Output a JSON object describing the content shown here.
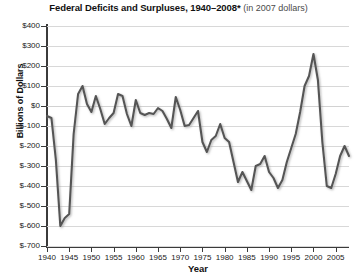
{
  "chart_data": {
    "type": "line",
    "title_main": "Federal Deficits and Surpluses, 1940–2008*",
    "title_sub": "(in 2007 dollars)",
    "xlabel": "Year",
    "ylabel": "Billions of Dollars",
    "grid": true,
    "legend": "none",
    "line_color": "#555555",
    "xlim": [
      1940,
      2008
    ],
    "ylim": [
      -700,
      400
    ],
    "ytick_values": [
      400,
      300,
      200,
      100,
      0,
      -100,
      -200,
      -300,
      -400,
      -500,
      -600,
      -700
    ],
    "ytick_labels": [
      "$400",
      "$300",
      "$200",
      "$100",
      "$0",
      "$-100",
      "$-200",
      "$-300",
      "$-400",
      "$-500",
      "$-600",
      "$-700"
    ],
    "xtick_values": [
      1940,
      1945,
      1950,
      1955,
      1960,
      1965,
      1970,
      1975,
      1980,
      1985,
      1990,
      1995,
      2000,
      2005
    ],
    "xtick_labels": [
      "1940",
      "1945",
      "1950",
      "1955",
      "1960",
      "1965",
      "1970",
      "1975",
      "1980",
      "1985",
      "1990",
      "1995",
      "2000",
      "2005"
    ],
    "x": [
      1940,
      1941,
      1942,
      1943,
      1944,
      1945,
      1946,
      1947,
      1948,
      1949,
      1950,
      1951,
      1952,
      1953,
      1954,
      1955,
      1956,
      1957,
      1958,
      1959,
      1960,
      1961,
      1962,
      1963,
      1964,
      1965,
      1966,
      1967,
      1968,
      1969,
      1970,
      1971,
      1972,
      1973,
      1974,
      1975,
      1976,
      1977,
      1978,
      1979,
      1980,
      1981,
      1982,
      1983,
      1984,
      1985,
      1986,
      1987,
      1988,
      1989,
      1990,
      1991,
      1992,
      1993,
      1994,
      1995,
      1996,
      1997,
      1998,
      1999,
      2000,
      2001,
      2002,
      2003,
      2004,
      2005,
      2006,
      2007,
      2008
    ],
    "values": [
      -50,
      -60,
      -270,
      -600,
      -560,
      -540,
      -140,
      60,
      100,
      10,
      -30,
      50,
      -15,
      -90,
      -60,
      -35,
      60,
      50,
      -40,
      -100,
      30,
      -35,
      -45,
      -35,
      -40,
      -10,
      -25,
      -65,
      -110,
      45,
      -20,
      -100,
      -95,
      -60,
      -25,
      -180,
      -230,
      -170,
      -150,
      -90,
      -160,
      -180,
      -280,
      -380,
      -330,
      -375,
      -420,
      -300,
      -290,
      -250,
      -330,
      -360,
      -410,
      -370,
      -280,
      -210,
      -140,
      -30,
      100,
      150,
      260,
      130,
      -180,
      -400,
      -410,
      -340,
      -250,
      -200,
      -250
    ],
    "annotations": []
  }
}
